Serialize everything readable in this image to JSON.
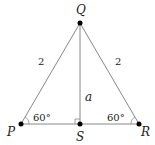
{
  "diagram": {
    "vertices": {
      "P": {
        "label": "P",
        "x": 21,
        "y": 124
      },
      "Q": {
        "label": "Q",
        "x": 80,
        "y": 23
      },
      "R": {
        "label": "R",
        "x": 139,
        "y": 124
      },
      "S": {
        "label": "S",
        "x": 80,
        "y": 124
      }
    },
    "sides": {
      "PQ": "2",
      "QR": "2",
      "QS": "a"
    },
    "angles": {
      "P": "60°",
      "R": "60°"
    },
    "right_angle_at": "S",
    "colors": {
      "line": "#888888",
      "point": "#000000",
      "text": "#222222"
    }
  }
}
